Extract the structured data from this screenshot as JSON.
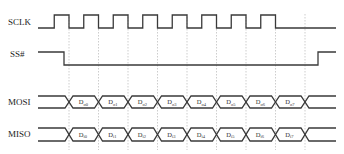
{
  "diagram": {
    "signals": [
      {
        "id": "sclk",
        "label": "SCLK",
        "type": "clock",
        "pulses": 8
      },
      {
        "id": "ss",
        "label": "SS#",
        "type": "level",
        "idle": "high",
        "active": "low"
      },
      {
        "id": "mosi",
        "label": "MOSI",
        "type": "bus",
        "bits": [
          "D",
          "D",
          "D",
          "D",
          "D",
          "D",
          "D",
          "D"
        ],
        "subs": [
          "o0",
          "o1",
          "o2",
          "o3",
          "o4",
          "o5",
          "o6",
          "o7"
        ]
      },
      {
        "id": "miso",
        "label": "MISO",
        "type": "bus",
        "bits": [
          "D",
          "D",
          "D",
          "D",
          "D",
          "D",
          "D",
          "D"
        ],
        "subs": [
          "i0",
          "i1",
          "i2",
          "i3",
          "i4",
          "i5",
          "i6",
          "i7"
        ]
      }
    ],
    "colors": {
      "line": "#3a3a3a",
      "grid": "#b8b8b8",
      "text": "#222222"
    }
  }
}
